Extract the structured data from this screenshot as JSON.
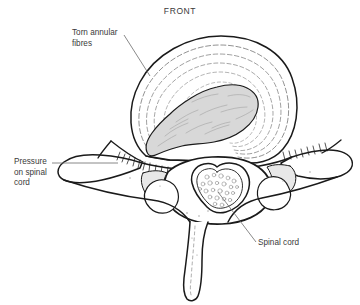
{
  "figure": {
    "title": "FRONT",
    "background_color": "#ffffff",
    "line_color": "#1a1a1a",
    "text_color": "#3a3a3a",
    "nucleus_fill": "#d8d8d8",
    "lamina_fill": "#e8e8e8",
    "leader_color": "#6b6b6b"
  },
  "labels": {
    "torn_annular_fibres": "Torn annular\nfibres",
    "pressure_on_spinal_cord": "Pressure\non spinal\ncord",
    "spinal_cord": "Spinal cord"
  },
  "anatomy": {
    "parts": [
      "intervertebral-disc",
      "annulus-fibrosus-rings",
      "nucleus-pulposus",
      "vertebral-body",
      "spinal-canal",
      "spinal-cord",
      "left-transverse-process",
      "right-transverse-process",
      "spinous-process",
      "ligament-hatching"
    ]
  }
}
